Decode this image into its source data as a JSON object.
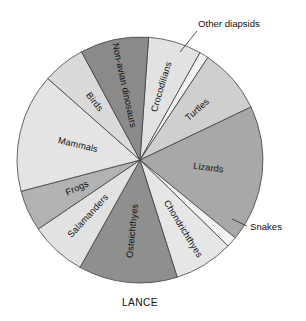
{
  "figure": {
    "caption": "LANCE",
    "background_color": "#ffffff",
    "outline_color": "#3a3a3a"
  },
  "chart_data": {
    "type": "pie",
    "title": "LANCE",
    "subtitle": "",
    "xlabel": "",
    "ylabel": "",
    "legend_position": "none",
    "grid": false,
    "units": "percent of taxa",
    "start_angle_deg": -86,
    "direction": "clockwise",
    "center_px": [
      140,
      160
    ],
    "radius_px": 123,
    "categories": [
      "Crocodilians",
      "Other diapsids",
      "Turtles",
      "Lizards",
      "Snakes",
      "Chondrichthyes",
      "Osteichthyes",
      "Salamanders",
      "Frogs",
      "Mammals",
      "Birds",
      "Non-avian dinosaurs"
    ],
    "values": [
      7.0,
      1.2,
      8.6,
      18.0,
      1.4,
      7.8,
      13.0,
      7.4,
      5.4,
      15.6,
      5.6,
      9.0
    ],
    "slice_colors": [
      "#e2e2e2",
      "#f2f2f2",
      "#cfcfcf",
      "#a8a8a8",
      "#f2f2f2",
      "#e6e6e6",
      "#8f8f8f",
      "#e2e2e2",
      "#b2b2b2",
      "#e4e4e4",
      "#dadada",
      "#8a8a8a"
    ],
    "label_placement": [
      "inside",
      "callout",
      "inside",
      "inside",
      "callout",
      "inside",
      "inside",
      "inside",
      "inside",
      "inside",
      "inside",
      "inside"
    ],
    "annotations": [
      {
        "text": "Other diapsids",
        "target": "Other diapsids",
        "side": "top-right"
      },
      {
        "text": "Snakes",
        "target": "Snakes",
        "side": "right"
      }
    ]
  },
  "slice_labels": {
    "crocodilians": "Crocodilians",
    "other_diapsids": "Other diapsids",
    "turtles": "Turtles",
    "lizards": "Lizards",
    "snakes": "Snakes",
    "chondrichthyes": "Chondrichthyes",
    "osteichthyes": "Osteichthyes",
    "salamanders": "Salamanders",
    "frogs": "Frogs",
    "mammals": "Mammals",
    "birds": "Birds",
    "non_avian_dinosaurs": "Non-avian dinosaurs"
  }
}
